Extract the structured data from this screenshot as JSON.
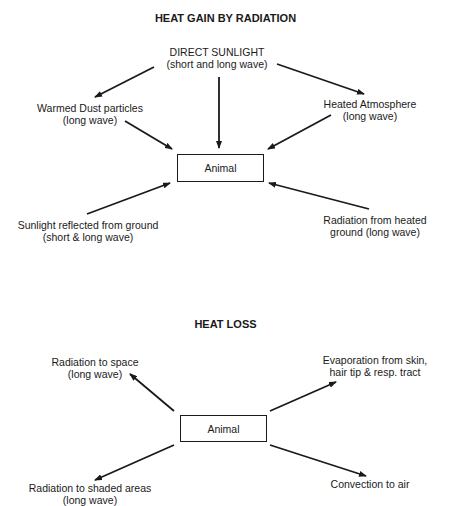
{
  "gain": {
    "title": "HEAT GAIN BY RADIATION",
    "center": "Animal",
    "sources": {
      "direct": {
        "line1": "DIRECT SUNLIGHT",
        "line2": "(short and long wave)"
      },
      "dust": {
        "line1": "Warmed Dust particles",
        "line2": "(long wave)"
      },
      "atmosphere": {
        "line1": "Heated Atmosphere",
        "line2": "(long wave)"
      },
      "reflected": {
        "line1": "Sunlight reflected from ground",
        "line2": "(short & long wave)"
      },
      "ground": {
        "line1": "Radiation from heated",
        "line2": "ground (long wave)"
      }
    }
  },
  "loss": {
    "title": "HEAT LOSS",
    "center": "Animal",
    "sinks": {
      "space": {
        "line1": "Radiation to space",
        "line2": "(long wave)"
      },
      "evaporation": {
        "line1": "Evaporation from skin,",
        "line2": "hair tip & resp. tract"
      },
      "shaded": {
        "line1": "Radiation to shaded areas",
        "line2": "(long wave)"
      },
      "convection": {
        "line1": "Convection to air"
      }
    }
  }
}
